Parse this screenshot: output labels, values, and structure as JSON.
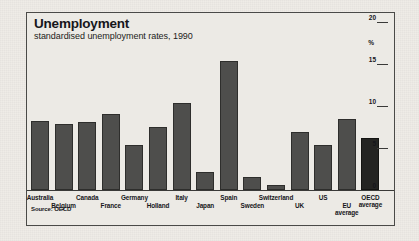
{
  "header": {
    "title": "Unemployment",
    "subtitle": "standardised unemployment rates, 1990"
  },
  "source_note": "Source: OECD",
  "axis": {
    "unit_label": "%",
    "ticks": [
      "0",
      "5",
      "10",
      "15",
      "20"
    ]
  },
  "chart_data": {
    "type": "bar",
    "title": "Unemployment",
    "subtitle": "standardised unemployment rates, 1990",
    "xlabel": "",
    "ylabel": "%",
    "ylim": [
      0,
      20
    ],
    "yticks": [
      0,
      5,
      10,
      15,
      20
    ],
    "grid": false,
    "legend": "none",
    "source": "Source: OECD",
    "categories": [
      "Australia",
      "Belgium",
      "Canada",
      "France",
      "Germany",
      "Holland",
      "Italy",
      "Japan",
      "Spain",
      "Sweden",
      "Switzerland",
      "UK",
      "US",
      "EU average",
      "OECD average"
    ],
    "values": [
      8.2,
      7.9,
      8.1,
      9.0,
      5.3,
      7.5,
      10.3,
      2.1,
      15.4,
      1.5,
      0.6,
      6.9,
      5.4,
      8.4,
      6.2
    ],
    "highlight_categories": [
      "OECD average"
    ],
    "colors": {
      "bar": "#4e4e4c",
      "bar_highlight": "#242422",
      "background": "#eceae5",
      "frame": "#4a4a48",
      "text": "#16161a"
    }
  }
}
